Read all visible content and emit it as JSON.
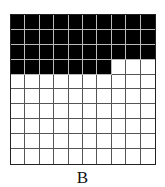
{
  "figure": {
    "label": "B",
    "grid": {
      "rows": 10,
      "cols": 10,
      "shaded_count": 37,
      "total_cells": 100,
      "shaded_color": "#000000",
      "unshaded_color": "#ffffff",
      "fill_order": "row-major from top-left"
    }
  }
}
